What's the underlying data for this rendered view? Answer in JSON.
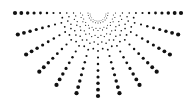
{
  "graphic": {
    "name": "radial-dot-sunburst",
    "description": "Half-circle burst of dots radiating downward from a top-center point",
    "background_color": "#ffffff",
    "dot_color": "#111111",
    "center": {
      "x": 98,
      "y": 13
    },
    "main_rays": {
      "count": 13,
      "start_angle_deg": 0,
      "end_angle_deg": 180,
      "inner_radius": 10,
      "outer_radius": 83,
      "dots_per_ray": 12,
      "min_dot_radius": 0.5,
      "max_dot_radius": 2.1
    },
    "inner_rays": {
      "count": 12,
      "start_angle_deg": 7.5,
      "step_deg": 15,
      "inner_radius": 8,
      "outer_radius": 36,
      "dots_per_ray": 5,
      "min_dot_radius": 0.45,
      "max_dot_radius": 0.9
    }
  }
}
